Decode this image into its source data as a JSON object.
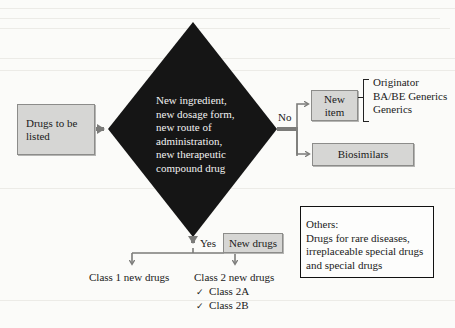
{
  "diagram": {
    "start": {
      "label": "Drugs to be listed"
    },
    "decision": {
      "lines": [
        "New ingredient,",
        "new dosage form,",
        "new route of",
        "administration,",
        "new therapeutic",
        "compound drug"
      ]
    },
    "no_branch": {
      "label": "No",
      "new_item": {
        "label_line1": "New",
        "label_line2": "item",
        "subtypes": [
          "Originator",
          "BA/BE Generics",
          "Generics"
        ]
      },
      "biosimilars": {
        "label": "Biosimilars"
      }
    },
    "yes_branch": {
      "label": "Yes",
      "tag": "New drugs",
      "class1": {
        "label": "Class 1 new drugs"
      },
      "class2": {
        "label": "Class 2 new drugs",
        "items": [
          {
            "mark": "✓",
            "label": "Class 2A"
          },
          {
            "mark": "✓",
            "label": "Class 2B"
          }
        ]
      }
    },
    "others": {
      "title": "Others:",
      "lines": [
        "Drugs for rare diseases,",
        "irreplaceable special drugs",
        "and special drugs"
      ]
    },
    "colors": {
      "diamond": "#151515",
      "box_fill": "#d6d6d4",
      "arrow": "#7b7b79"
    }
  }
}
